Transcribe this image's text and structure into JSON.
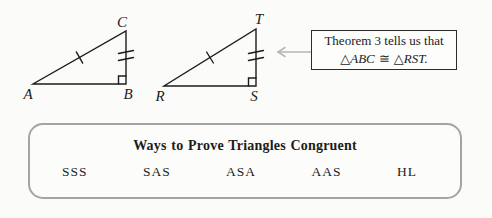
{
  "colors": {
    "ink": "#1c1c1c",
    "arrow_gray": "#b5b5b5",
    "panel_border": "#a4a4a4",
    "background": "#fbfbf9"
  },
  "figure": {
    "left_triangle": {
      "vertex_labels": [
        "A",
        "B",
        "C"
      ],
      "marks": [
        "single-tick-on-AC",
        "double-tick-on-BC",
        "right-angle-at-B"
      ]
    },
    "right_triangle": {
      "vertex_labels": [
        "R",
        "S",
        "T"
      ],
      "marks": [
        "single-tick-on-RT",
        "double-tick-on-ST",
        "right-angle-at-S"
      ]
    },
    "callout": {
      "line1": "Theorem 3 tells us that",
      "line2_parts": {
        "triangle_symbol_1": "△",
        "triangle_name_1": "ABC",
        "congruence_symbol": "≅",
        "triangle_symbol_2": "△",
        "triangle_name_2": "RST",
        "period": "."
      }
    }
  },
  "panel": {
    "title": "Ways to Prove Triangles Congruent",
    "methods": [
      "SSS",
      "SAS",
      "ASA",
      "AAS",
      "HL"
    ]
  }
}
